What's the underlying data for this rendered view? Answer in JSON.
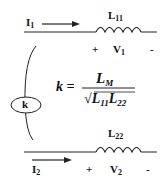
{
  "diagram": {
    "type": "coupled-inductors",
    "primary": {
      "current_label": "I",
      "current_sub": "1",
      "inductor_label": "L",
      "inductor_sub": "11",
      "voltage_plus": "+",
      "voltage_label": "V",
      "voltage_sub": "1",
      "voltage_minus": "-"
    },
    "secondary": {
      "current_label": "I",
      "current_sub": "2",
      "inductor_label": "L",
      "inductor_sub": "22",
      "voltage_plus": "+",
      "voltage_label": "V",
      "voltage_sub": "2",
      "voltage_minus": "-"
    },
    "coupling": {
      "symbol": "k",
      "equation_lhs": "k =",
      "numerator": "L",
      "numerator_sub": "M",
      "denominator_sqrt": "√",
      "denominator_a": "L",
      "denominator_a_sub": "11",
      "denominator_b": "L",
      "denominator_b_sub": "22"
    },
    "colors": {
      "ink": "#111111",
      "background": "#ffffff"
    }
  }
}
